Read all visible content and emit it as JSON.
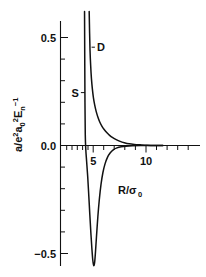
{
  "chart_data": {
    "type": "line",
    "title": "",
    "xlabel": "R/σ₀",
    "ylabel": "α/e²a₀²Eₙ⁻¹",
    "xlabel_parts": {
      "main": "R/σ",
      "sub": "0"
    },
    "ylabel_parts": {
      "p1": "a/e",
      "sup1": "2",
      "p2": "a",
      "sub1": "0",
      "sup2": "2",
      "p3": "E",
      "sub2": "n",
      "sup3": "−1"
    },
    "xlim": [
      2.0,
      12.6
    ],
    "ylim": [
      -0.62,
      0.62
    ],
    "xticks_major": [
      5,
      10
    ],
    "xticklabels": [
      "5",
      "10"
    ],
    "xticks_minor": [
      3,
      4,
      6,
      7,
      8,
      9,
      11,
      12
    ],
    "yticks_major": [
      0.5,
      0.0,
      -0.5
    ],
    "yticklabels": [
      "0.5",
      "0.0",
      "−0.5"
    ],
    "yticks_minor": [
      0.4,
      0.3,
      0.2,
      0.1,
      -0.1,
      -0.2,
      -0.3,
      -0.4
    ],
    "grid": false,
    "legend": "inline-annotations",
    "series": [
      {
        "name": "S",
        "label": "S",
        "label_x": 3.65,
        "label_y": 0.245,
        "leader_to_x": 4.22,
        "leader_to_y": 0.245,
        "description": "Singlet: steep near-vertical descent from +0.6 at R~4.2, crossing zero near R=4.35, deep minimum of -0.555 at R=5.05, rising back to zero by R~8",
        "points": [
          [
            4.18,
            0.62
          ],
          [
            4.2,
            0.4
          ],
          [
            4.22,
            0.2
          ],
          [
            4.25,
            0.05
          ],
          [
            4.3,
            -0.02
          ],
          [
            4.38,
            -0.075
          ],
          [
            4.48,
            -0.145
          ],
          [
            4.58,
            -0.23
          ],
          [
            4.68,
            -0.32
          ],
          [
            4.78,
            -0.405
          ],
          [
            4.88,
            -0.48
          ],
          [
            4.96,
            -0.53
          ],
          [
            5.03,
            -0.553
          ],
          [
            5.08,
            -0.555
          ],
          [
            5.14,
            -0.54
          ],
          [
            5.22,
            -0.49
          ],
          [
            5.32,
            -0.415
          ],
          [
            5.44,
            -0.33
          ],
          [
            5.58,
            -0.25
          ],
          [
            5.74,
            -0.18
          ],
          [
            5.92,
            -0.125
          ],
          [
            6.12,
            -0.085
          ],
          [
            6.35,
            -0.055
          ],
          [
            6.6,
            -0.035
          ],
          [
            6.9,
            -0.02
          ],
          [
            7.25,
            -0.011
          ],
          [
            7.65,
            -0.006
          ],
          [
            8.1,
            -0.003
          ],
          [
            8.7,
            -0.001
          ],
          [
            9.5,
            0.0
          ],
          [
            10.5,
            0.0
          ],
          [
            11.6,
            0.0
          ]
        ]
      },
      {
        "name": "D",
        "label": "D",
        "label_x": 5.35,
        "label_y": 0.455,
        "leader_to_x": 4.85,
        "leader_to_y": 0.455,
        "description": "Doublet: steeply decaying positive curve from +0.62 near R=4.6, falling monotonically toward zero asymptote beyond R~8",
        "points": [
          [
            4.62,
            0.62
          ],
          [
            4.66,
            0.52
          ],
          [
            4.7,
            0.44
          ],
          [
            4.76,
            0.37
          ],
          [
            4.83,
            0.312
          ],
          [
            4.92,
            0.262
          ],
          [
            5.02,
            0.222
          ],
          [
            5.14,
            0.188
          ],
          [
            5.28,
            0.158
          ],
          [
            5.44,
            0.132
          ],
          [
            5.62,
            0.109
          ],
          [
            5.82,
            0.09
          ],
          [
            6.04,
            0.074
          ],
          [
            6.28,
            0.06
          ],
          [
            6.55,
            0.047
          ],
          [
            6.85,
            0.036
          ],
          [
            7.18,
            0.027
          ],
          [
            7.55,
            0.019
          ],
          [
            7.95,
            0.013
          ],
          [
            8.4,
            0.008
          ],
          [
            8.9,
            0.005
          ],
          [
            9.45,
            0.003
          ],
          [
            10.1,
            0.001
          ],
          [
            10.9,
            0.0
          ],
          [
            11.6,
            0.0
          ]
        ]
      }
    ]
  },
  "annotations": {
    "s_label": "S",
    "d_label": "D"
  }
}
